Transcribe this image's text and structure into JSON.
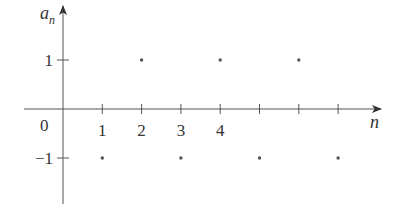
{
  "chart_data": {
    "type": "scatter",
    "title": "",
    "xlabel": "n",
    "ylabel": "a_n",
    "ylabel_main": "a",
    "ylabel_sub": "n",
    "origin_label": "0",
    "x_tick_labels": [
      "1",
      "2",
      "3",
      "4"
    ],
    "x_ticks": [
      1,
      2,
      3,
      4,
      5,
      6,
      7
    ],
    "y_ticks": [
      1,
      -1
    ],
    "y_tick_labels": [
      "1",
      "−1"
    ],
    "x": [
      1,
      2,
      3,
      4,
      5,
      6,
      7
    ],
    "values": [
      -1,
      1,
      -1,
      1,
      -1,
      1,
      -1
    ],
    "xlim": [
      0,
      7.5
    ],
    "ylim": [
      -2,
      2.1
    ],
    "grid": false,
    "legend": null,
    "colors": {
      "axis": "#555555",
      "point": "#555555",
      "text": "#333333"
    }
  }
}
